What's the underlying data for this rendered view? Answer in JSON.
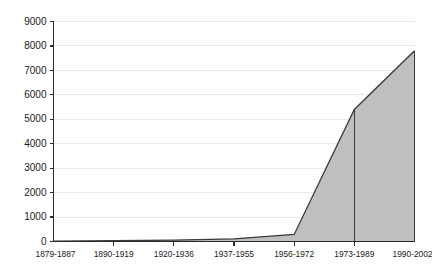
{
  "chart_data": {
    "type": "area",
    "title": "",
    "subtitle": "",
    "xlabel": "",
    "ylabel": "",
    "categories": [
      "1879-1887",
      "1890-1919",
      "1920-1936",
      "1937-1955",
      "1956-1972",
      "1973-1989",
      "1990-2002"
    ],
    "values": [
      10,
      30,
      60,
      110,
      290,
      5400,
      7800
    ],
    "ylim": [
      0,
      9000
    ],
    "ytick_values": [
      0,
      1000,
      2000,
      3000,
      4000,
      5000,
      6000,
      7000,
      8000,
      9000
    ],
    "ytick_labels": [
      "0",
      "1000",
      "2000",
      "3000",
      "4000",
      "5000",
      "6000",
      "7000",
      "8000",
      "9000"
    ],
    "grid": true,
    "legend": false,
    "legend_position": "none",
    "colors": {
      "area_fill": "#bfbfbf",
      "area_outline": "#3a3a3a",
      "gridline": "#e8e8e8",
      "axis": "#2b2b2b",
      "text": "#1a1a1a",
      "background": "#ffffff"
    }
  }
}
